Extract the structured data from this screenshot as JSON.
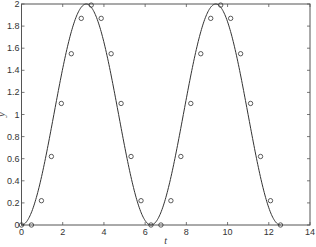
{
  "chart_data": {
    "type": "line",
    "title": "",
    "xlabel": "t",
    "ylabel": "y",
    "xlim": [
      0,
      14
    ],
    "ylim": [
      0,
      2
    ],
    "xticks": [
      0,
      2,
      4,
      6,
      8,
      10,
      12,
      14
    ],
    "yticks": [
      0,
      0.2,
      0.4,
      0.6,
      0.8,
      1,
      1.2,
      1.4,
      1.6,
      1.8,
      2
    ],
    "xtick_labels": [
      "0",
      "2",
      "4",
      "6",
      "8",
      "10",
      "12",
      "14"
    ],
    "ytick_labels": [
      "0",
      "0.2",
      "0.4",
      "0.6",
      "0.8",
      "1",
      "1.2",
      "1.4",
      "1.6",
      "1.8",
      "2"
    ],
    "grid": false,
    "legend": null,
    "series": [
      {
        "name": "curve",
        "style": "solid-line",
        "function": "1 - cos(t)",
        "t_range": [
          0,
          12.566
        ]
      },
      {
        "name": "samples",
        "style": "open-circle-markers",
        "x": [
          0,
          0.483,
          0.967,
          1.45,
          1.933,
          2.417,
          2.9,
          3.383,
          3.867,
          4.35,
          4.833,
          5.316,
          5.8,
          6.283,
          6.766,
          7.25,
          7.733,
          8.216,
          8.7,
          9.183,
          9.666,
          10.15,
          10.633,
          11.116,
          11.6,
          12.083,
          12.566
        ],
        "y": [
          0,
          0,
          0.22,
          0.62,
          1.1,
          1.55,
          1.87,
          1.99,
          1.87,
          1.55,
          1.1,
          0.62,
          0.22,
          0,
          0,
          0.22,
          0.62,
          1.1,
          1.55,
          1.87,
          1.99,
          1.87,
          1.55,
          1.1,
          0.62,
          0.22,
          0
        ]
      }
    ]
  },
  "colors": {
    "line": "#333333",
    "axis": "#555555",
    "background": "#ffffff"
  }
}
